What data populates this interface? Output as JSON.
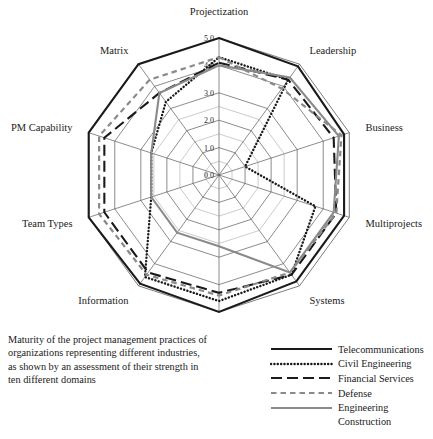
{
  "caption": "Maturity of the project management practices of organizations representing different industries, as shown by an assessment of their strength in ten different domains",
  "legend": {
    "items": [
      {
        "label": "Telecommunications",
        "style": "solid",
        "color": "#1a1a1a",
        "width": 2.1
      },
      {
        "label": "Civil Engineering",
        "style": "dotted",
        "color": "#1a1a1a",
        "width": 2.4
      },
      {
        "label": "Financial Services",
        "style": "long-dash",
        "color": "#1a1a1a",
        "width": 2.1
      },
      {
        "label": "Defense",
        "style": "short-dash",
        "color": "#8a8a8a",
        "width": 2.2
      },
      {
        "label": "Engineering",
        "style": "solid",
        "color": "#8a8a8a",
        "width": 2.1
      }
    ],
    "continuation": "Construction"
  },
  "chart_data": {
    "type": "radar",
    "title": "",
    "categories": [
      "Projectization",
      "Leadership",
      "Business",
      "Multiprojects",
      "Systems",
      "Authorization",
      "Information",
      "Team Types",
      "PM Capability",
      "Matrix"
    ],
    "tick_labels": [
      "0.0",
      "1.0",
      "2.0",
      "3.0",
      "4.0",
      "5.0"
    ],
    "rlim": [
      0,
      5
    ],
    "rticks": [
      0,
      1,
      2,
      3,
      4,
      5
    ],
    "grid": true,
    "legend_position": "bottom-right",
    "series": [
      {
        "name": "Telecommunications",
        "color": "#1a1a1a",
        "style": "solid",
        "width": 2.1,
        "values": [
          5.0,
          4.9,
          4.8,
          4.8,
          4.8,
          5.0,
          4.9,
          5.0,
          5.0,
          5.0
        ]
      },
      {
        "name": "Civil Engineering",
        "color": "#1a1a1a",
        "style": "dotted",
        "width": 2.4,
        "values": [
          4.3,
          4.3,
          1.0,
          3.7,
          4.5,
          4.6,
          4.6,
          2.6,
          2.6,
          3.3
        ]
      },
      {
        "name": "Financial Services",
        "color": "#1a1a1a",
        "style": "long-dash",
        "width": 2.1,
        "values": [
          4.1,
          4.3,
          4.4,
          4.5,
          4.5,
          4.3,
          4.4,
          4.4,
          4.4,
          3.7
        ]
      },
      {
        "name": "Defense",
        "color": "#8a8a8a",
        "style": "short-dash",
        "width": 2.2,
        "values": [
          4.3,
          3.9,
          4.7,
          4.5,
          4.4,
          4.4,
          4.5,
          4.6,
          4.6,
          4.3
        ]
      },
      {
        "name": "Engineering Construction",
        "color": "#8a8a8a",
        "style": "solid",
        "width": 2.1,
        "values": [
          4.0,
          4.4,
          4.6,
          4.4,
          4.4,
          2.6,
          2.6,
          2.6,
          2.6,
          3.7
        ]
      }
    ]
  },
  "geometry": {
    "cx": 219,
    "cy": 175,
    "r_max": 137,
    "label_offset": 17
  }
}
